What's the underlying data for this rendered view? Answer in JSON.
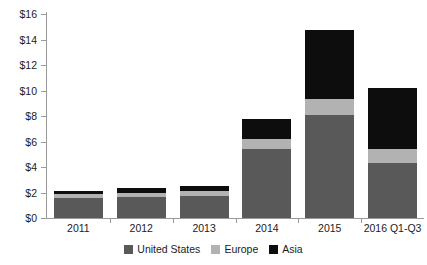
{
  "chart_data": {
    "type": "bar",
    "subtype": "stacked-bar",
    "title": "",
    "xlabel": "",
    "ylabel": "",
    "categories": [
      "2011",
      "2012",
      "2013",
      "2014",
      "2015",
      "2016 Q1-Q3"
    ],
    "series": [
      {
        "name": "United States",
        "color": "#595959",
        "values": [
          1.6,
          1.65,
          1.7,
          5.4,
          8.1,
          4.3
        ]
      },
      {
        "name": "Europe",
        "color": "#b2b2b2",
        "values": [
          0.3,
          0.35,
          0.4,
          0.8,
          1.2,
          1.1
        ]
      },
      {
        "name": "Asia",
        "color": "#0d0d0d",
        "values": [
          0.2,
          0.35,
          0.4,
          1.6,
          5.45,
          4.8
        ]
      }
    ],
    "totals": [
      2.1,
      2.35,
      2.5,
      7.8,
      14.75,
      10.2
    ],
    "ylim": [
      0,
      16
    ],
    "ytick_values": [
      0,
      2,
      4,
      6,
      8,
      10,
      12,
      14,
      16
    ],
    "ytick_labels": [
      "$0",
      "$2",
      "$4",
      "$6",
      "$8",
      "$10",
      "$12",
      "$14",
      "$16"
    ],
    "grid": false,
    "legend_position": "bottom"
  },
  "legend": {
    "items": [
      {
        "label": "United States",
        "color": "#595959"
      },
      {
        "label": "Europe",
        "color": "#b2b2b2"
      },
      {
        "label": "Asia",
        "color": "#0d0d0d"
      }
    ]
  },
  "axis": {
    "y_axis_color": "#9a9a9a",
    "x_axis_color": "#9a9a9a"
  }
}
